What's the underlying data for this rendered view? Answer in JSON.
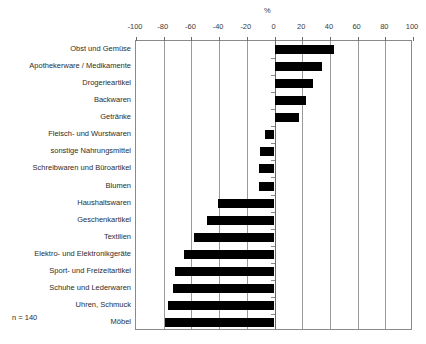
{
  "note": "n = 140",
  "chart_data": {
    "type": "bar",
    "orientation": "horizontal",
    "title": "",
    "subtitle": "",
    "xlabel": "%",
    "ylabel": "",
    "xlim": [
      -100,
      100
    ],
    "xticks": [
      -100,
      -80,
      -60,
      -40,
      -20,
      0,
      20,
      40,
      60,
      80,
      100
    ],
    "xtick_labels": [
      "-100",
      "-80",
      "-60",
      "-40",
      "-20",
      "0",
      "20",
      "40",
      "60",
      "80",
      "100"
    ],
    "grid": true,
    "legend": false,
    "legend_position": "none",
    "bar_color": "#000000",
    "categories": [
      "Obst und Gemüse",
      "Apothekerware / Medikamente",
      "Drogerieartikel",
      "Backwaren",
      "Getränke",
      "Fleisch- und Wurstwaren",
      "sonstige Nahrungsmittel",
      "Schreibwaren und Büroartikel",
      "Blumen",
      "Haushaltswaren",
      "Geschenkartikel",
      "Textilien",
      "Elektro- und Elektronikgeräte",
      "Sport- und Freizeitartikel",
      "Schuhe und Lederwaren",
      "Uhren, Schmuck",
      "Möbel"
    ],
    "values": [
      43,
      34,
      28,
      23,
      17.5,
      -6.5,
      -10.5,
      -11.5,
      -11.5,
      -41,
      -49,
      -58,
      -65,
      -72,
      -73.5,
      -77,
      -79
    ],
    "annotations": [
      "n = 140"
    ]
  }
}
